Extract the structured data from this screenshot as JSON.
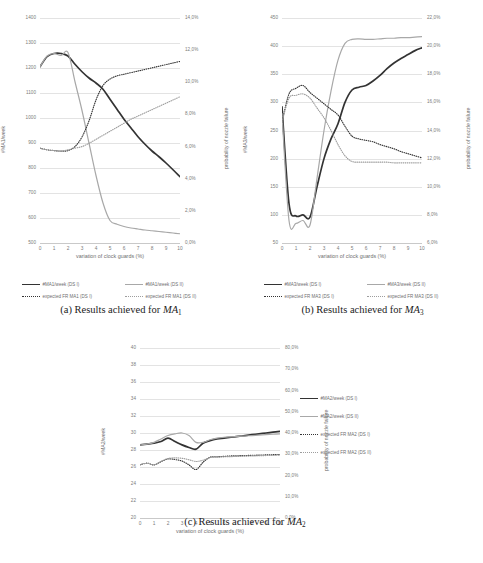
{
  "page": {
    "background": "#ffffff",
    "width": 483,
    "height": 563
  },
  "colors": {
    "series_ds1": "#333333",
    "series_ds2": "#a8a8a8",
    "expected_ds1": "#333333",
    "expected_ds2": "#9d9d9d",
    "grid": "#e3e3e3",
    "tick_text": "#7a7a7a",
    "axis_title": "#6f6f6f"
  },
  "figures": [
    {
      "id": "ma1",
      "caption_prefix": "(a) Results achieved for ",
      "caption_symbol": "MA",
      "caption_sub": "1",
      "xlabel": "variation of clock guards (%)",
      "ylabel_left": "#MA1/week",
      "ylabel_right": "probability of nozzle failure",
      "xticks": [
        "0",
        "1",
        "2",
        "3",
        "4",
        "5",
        "6",
        "7",
        "8",
        "9",
        "10"
      ],
      "yticks_left": [
        "500",
        "600",
        "700",
        "800",
        "900",
        "1000",
        "1100",
        "1200",
        "1300",
        "1400"
      ],
      "yticks_right": [
        "0,0%",
        "2,0%",
        "4,0%",
        "6,0%",
        "8,0%",
        "10,0%",
        "12,0%",
        "14,0%"
      ],
      "legend": [
        {
          "label": "#MA1/week (DS I)",
          "key": "solid-dark"
        },
        {
          "label": "#MA1/week (DS II)",
          "key": "solid-gray"
        },
        {
          "label": "expected FR MA1 (DS I)",
          "key": "dot-dark"
        },
        {
          "label": "expected FR MA1 (DS II)",
          "key": "dot-gray"
        }
      ],
      "chart_data": {
        "type": "line",
        "title": "Results achieved for MA1",
        "xlabel": "variation of clock guards (%)",
        "ylabel": "#MA1/week",
        "ylabel_secondary": "probability of nozzle failure",
        "x": [
          0,
          0.5,
          1,
          1.5,
          2,
          2.5,
          3,
          3.5,
          4,
          4.5,
          5,
          5.5,
          6,
          6.5,
          7,
          7.5,
          8,
          8.5,
          9,
          9.5,
          10
        ],
        "xlim": [
          0,
          10
        ],
        "ylim": [
          500,
          1400
        ],
        "ylim_secondary": [
          0.0,
          14.0
        ],
        "grid": true,
        "legend_position": "bottom",
        "series": [
          {
            "name": "#MA1/week (DS I)",
            "axis": "left",
            "style": "solid",
            "color": "#333333",
            "values": [
              1205,
              1245,
              1258,
              1258,
              1248,
              1215,
              1185,
              1160,
              1140,
              1115,
              1075,
              1035,
              995,
              960,
              925,
              895,
              868,
              845,
              820,
              793,
              765
            ]
          },
          {
            "name": "#MA1/week (DS II)",
            "axis": "left",
            "style": "solid",
            "color": "#a8a8a8",
            "values": [
              1205,
              1248,
              1258,
              1250,
              1262,
              1145,
              1030,
              900,
              770,
              660,
              590,
              575,
              566,
              560,
              556,
              552,
              549,
              546,
              543,
              540,
              537
            ]
          },
          {
            "name": "expected FR MA1 (DS I)",
            "axis": "right",
            "style": "dotted",
            "color": "#333333",
            "values": [
              5.9,
              5.8,
              5.75,
              5.72,
              5.75,
              6.0,
              6.6,
              7.6,
              8.9,
              9.8,
              10.2,
              10.4,
              10.5,
              10.6,
              10.7,
              10.8,
              10.9,
              11.0,
              11.1,
              11.2,
              11.3
            ]
          },
          {
            "name": "expected FR MA1 (DS II)",
            "axis": "right",
            "style": "dotted",
            "color": "#9d9d9d",
            "values": [
              5.9,
              5.8,
              5.75,
              5.72,
              5.8,
              5.9,
              6.0,
              6.2,
              6.45,
              6.7,
              6.95,
              7.2,
              7.45,
              7.7,
              7.9,
              8.1,
              8.3,
              8.5,
              8.7,
              8.9,
              9.1
            ]
          }
        ]
      }
    },
    {
      "id": "ma3",
      "caption_prefix": "(b) Results achieved for ",
      "caption_symbol": "MA",
      "caption_sub": "3",
      "xlabel": "variation of clock guards (%)",
      "ylabel_left": "#MA3/week",
      "ylabel_right": "probability of nozzle failure",
      "xticks": [
        "0",
        "1",
        "2",
        "3",
        "4",
        "5",
        "6",
        "7",
        "8",
        "9",
        "10"
      ],
      "yticks_left": [
        "50",
        "100",
        "150",
        "200",
        "250",
        "300",
        "350",
        "400",
        "450"
      ],
      "yticks_right": [
        "6,0%",
        "8,0%",
        "10,0%",
        "12,0%",
        "14,0%",
        "16,0%",
        "18,0%",
        "20,0%",
        "22,0%"
      ],
      "legend": [
        {
          "label": "#MA3/week (DS I)",
          "key": "solid-dark"
        },
        {
          "label": "#MA3/week (DS II)",
          "key": "solid-gray"
        },
        {
          "label": "expected FR MA3 (DS I)",
          "key": "dot-dark"
        },
        {
          "label": "expected FR MA3 (DS II)",
          "key": "dot-gray"
        }
      ],
      "chart_data": {
        "type": "line",
        "title": "Results achieved for MA3",
        "xlabel": "variation of clock guards (%)",
        "ylabel": "#MA3/week",
        "ylabel_secondary": "probability of nozzle failure",
        "x": [
          0,
          0.5,
          1,
          1.5,
          2,
          2.5,
          3,
          3.5,
          4,
          4.5,
          5,
          5.5,
          6,
          6.5,
          7,
          7.5,
          8,
          8.5,
          9,
          9.5,
          10
        ],
        "xlim": [
          0,
          10
        ],
        "ylim": [
          50,
          450
        ],
        "ylim_secondary": [
          6.0,
          22.0
        ],
        "grid": true,
        "legend_position": "bottom",
        "series": [
          {
            "name": "#MA3/week (DS I)",
            "axis": "left",
            "style": "solid",
            "color": "#333333",
            "values": [
              292,
              120,
              98,
              100,
              96,
              150,
              200,
              235,
              262,
              300,
              322,
              327,
              330,
              338,
              348,
              360,
              370,
              378,
              385,
              392,
              397
            ]
          },
          {
            "name": "#MA3/week (DS II)",
            "axis": "left",
            "style": "solid",
            "color": "#a8a8a8",
            "values": [
              280,
              90,
              85,
              90,
              82,
              165,
              250,
              320,
              375,
              405,
              412,
              413,
              412,
              412,
              413,
              414,
              414,
              415,
              415,
              416,
              417
            ]
          },
          {
            "name": "expected FR MA3 (DS I)",
            "axis": "right",
            "style": "dotted",
            "color": "#333333",
            "values": [
              14.6,
              16.6,
              17.0,
              17.2,
              16.7,
              16.3,
              15.9,
              15.5,
              15.1,
              14.3,
              13.6,
              13.4,
              13.3,
              13.2,
              13.0,
              12.85,
              12.7,
              12.5,
              12.35,
              12.2,
              12.05
            ]
          },
          {
            "name": "expected FR MA3 (DS II)",
            "axis": "right",
            "style": "dotted",
            "color": "#9d9d9d",
            "values": [
              14.6,
              16.3,
              16.5,
              16.6,
              16.3,
              15.6,
              14.9,
              14.0,
              13.0,
              12.2,
              11.8,
              11.75,
              11.75,
              11.75,
              11.75,
              11.75,
              11.7,
              11.7,
              11.7,
              11.7,
              11.7
            ]
          }
        ]
      }
    },
    {
      "id": "ma2",
      "caption_prefix": "(c) Results achieved for ",
      "caption_symbol": "MA",
      "caption_sub": "2",
      "xlabel": "variation of clock guards (%)",
      "ylabel_left": "#MA2/week",
      "ylabel_right": "probability of nozzle failure",
      "xticks": [
        "0",
        "1",
        "2",
        "3",
        "4",
        "5",
        "6",
        "7",
        "8",
        "9",
        "10"
      ],
      "yticks_left": [
        "20",
        "22",
        "24",
        "26",
        "28",
        "30",
        "32",
        "34",
        "36",
        "38",
        "40"
      ],
      "yticks_right": [
        "0,0%",
        "10,0%",
        "20,0%",
        "30,0%",
        "40,0%",
        "50,0%",
        "60,0%",
        "70,0%",
        "80,0%"
      ],
      "legend": [
        {
          "label": "#MA2/week (DS I)",
          "key": "solid-dark"
        },
        {
          "label": "#MA2/week (DS II)",
          "key": "solid-gray"
        },
        {
          "label": "expected FR MA2 (DS I)",
          "key": "dot-dark"
        },
        {
          "label": "expected FR MA2 (DS II)",
          "key": "dot-gray"
        }
      ],
      "chart_data": {
        "type": "line",
        "title": "Results achieved for MA2",
        "xlabel": "variation of clock guards (%)",
        "ylabel": "#MA2/week",
        "ylabel_secondary": "probability of nozzle failure",
        "x": [
          0,
          0.5,
          1,
          1.5,
          2,
          2.5,
          3,
          3.5,
          4,
          4.5,
          5,
          5.5,
          6,
          6.5,
          7,
          7.5,
          8,
          8.5,
          9,
          9.5,
          10
        ],
        "xlim": [
          0,
          10
        ],
        "ylim": [
          20,
          40
        ],
        "ylim_secondary": [
          0.0,
          80.0
        ],
        "grid": true,
        "legend_position": "right",
        "series": [
          {
            "name": "#MA2/week (DS I)",
            "axis": "left",
            "style": "solid",
            "color": "#333333",
            "values": [
              28.6,
              28.7,
              28.8,
              29.0,
              29.4,
              29.0,
              28.6,
              28.3,
              28.1,
              28.8,
              29.1,
              29.3,
              29.4,
              29.5,
              29.6,
              29.7,
              29.8,
              29.9,
              30.0,
              30.1,
              30.2
            ]
          },
          {
            "name": "#MA2/week (DS II)",
            "axis": "left",
            "style": "solid",
            "color": "#a8a8a8",
            "values": [
              28.6,
              28.7,
              28.9,
              29.3,
              29.7,
              29.9,
              30.0,
              29.7,
              28.9,
              28.9,
              29.2,
              29.4,
              29.5,
              29.55,
              29.6,
              29.65,
              29.7,
              29.75,
              29.8,
              29.85,
              29.9
            ]
          },
          {
            "name": "expected FR MA2 (DS I)",
            "axis": "right",
            "style": "dotted",
            "color": "#333333",
            "values": [
              25.0,
              25.8,
              25.0,
              26.5,
              27.8,
              27.5,
              26.8,
              25.0,
              22.8,
              26.2,
              28.6,
              28.8,
              29.0,
              29.2,
              29.3,
              29.4,
              29.5,
              29.6,
              29.7,
              29.8,
              29.9
            ]
          },
          {
            "name": "expected FR MA2 (DS II)",
            "axis": "right",
            "style": "dotted",
            "color": "#9d9d9d",
            "values": [
              25.0,
              25.8,
              25.0,
              26.6,
              28.0,
              28.3,
              28.1,
              27.4,
              26.6,
              27.2,
              28.4,
              28.6,
              28.8,
              28.9,
              29.0,
              29.1,
              29.2,
              29.3,
              29.4,
              29.5,
              29.6
            ]
          }
        ]
      }
    }
  ]
}
